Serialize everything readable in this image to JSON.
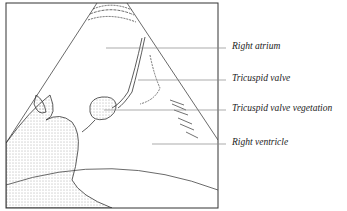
{
  "figure": {
    "type": "echocardiogram-illustration",
    "labels": [
      {
        "text": "Right atrium",
        "y": 48
      },
      {
        "text": "Tricuspid valve",
        "y": 80
      },
      {
        "text": "Tricuspid valve vegetation",
        "y": 110
      },
      {
        "text": "Right ventricle",
        "y": 144
      }
    ]
  }
}
